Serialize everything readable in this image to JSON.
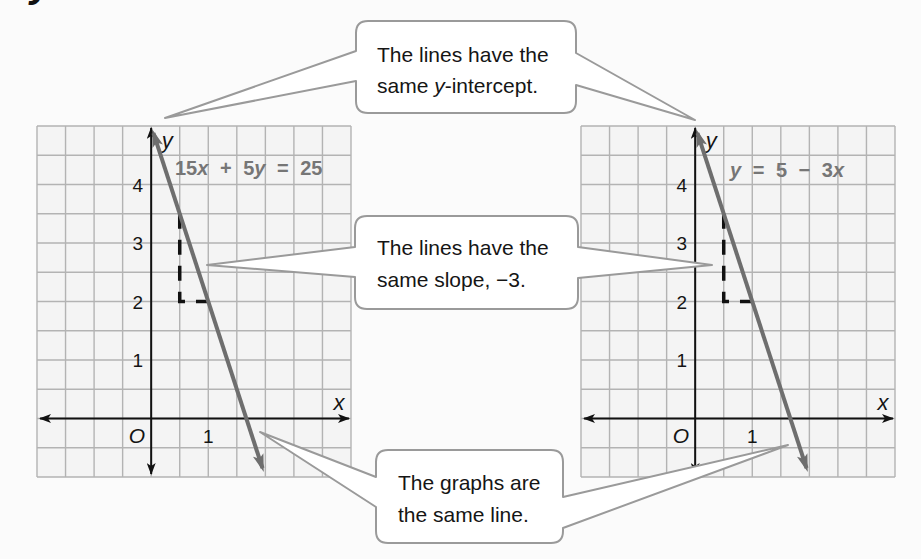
{
  "heading_fragment": "y",
  "colors": {
    "page_background": "#fbfbfb",
    "grid_fill": "#f4f4f4",
    "grid_line": "#b3b3b3",
    "axis": "#111111",
    "graph_line": "#6e6e6e",
    "slope_triangle": "#111111",
    "equation_text": "#767676",
    "callout_fill": "#ffffff",
    "callout_border": "#9a9a9a",
    "text": "#151515"
  },
  "callouts": [
    {
      "id": "same-y-intercept",
      "lines": [
        [
          {
            "text": "The lines have the"
          }
        ],
        [
          {
            "text": "same "
          },
          {
            "text": "y",
            "italic": true
          },
          {
            "text": "-intercept."
          }
        ]
      ]
    },
    {
      "id": "same-slope",
      "lines": [
        [
          {
            "text": "The lines have the"
          }
        ],
        [
          {
            "text": "same slope, −3."
          }
        ]
      ]
    },
    {
      "id": "same-line",
      "lines": [
        [
          {
            "text": "The graphs are"
          }
        ],
        [
          {
            "text": "the same line."
          }
        ]
      ]
    }
  ],
  "chart_data": [
    {
      "id": "standard-form",
      "type": "line",
      "title": "",
      "equation": "15x + 5y = 25",
      "equation_label": [
        {
          "text": "15"
        },
        {
          "text": "x",
          "italic": true
        },
        {
          "text": " + 5"
        },
        {
          "text": "y",
          "italic": true
        },
        {
          "text": " = 25"
        }
      ],
      "xlabel": "x",
      "ylabel": "y",
      "origin_label": "O",
      "xlim": [
        -2,
        3.5
      ],
      "ylim": [
        -1,
        5
      ],
      "grid": true,
      "grid_step": 0.5,
      "x_tick_labels": [
        {
          "value": 1,
          "label": "1"
        }
      ],
      "y_tick_labels": [
        {
          "value": 1,
          "label": "1"
        },
        {
          "value": 2,
          "label": "2"
        },
        {
          "value": 3,
          "label": "3"
        },
        {
          "value": 4,
          "label": "4"
        }
      ],
      "series": [
        {
          "name": "15x + 5y = 25",
          "slope": -3,
          "y_intercept": 5,
          "x": [
            0.04,
            1.95
          ],
          "y": [
            4.88,
            -0.85
          ],
          "arrows": "both"
        }
      ],
      "slope_triangle": {
        "points": [
          [
            0.5,
            3.5
          ],
          [
            0.5,
            2
          ],
          [
            1,
            2
          ]
        ],
        "rise": -1.5,
        "run": 0.5
      }
    },
    {
      "id": "slope-intercept-form",
      "type": "line",
      "title": "",
      "equation": "y = 5 − 3x",
      "equation_label": [
        {
          "text": "y",
          "italic": true
        },
        {
          "text": " = 5 − 3"
        },
        {
          "text": "x",
          "italic": true
        }
      ],
      "xlabel": "x",
      "ylabel": "y",
      "origin_label": "O",
      "xlim": [
        -2,
        3.5
      ],
      "ylim": [
        -1,
        5
      ],
      "grid": true,
      "grid_step": 0.5,
      "x_tick_labels": [
        {
          "value": 1,
          "label": "1"
        }
      ],
      "y_tick_labels": [
        {
          "value": 1,
          "label": "1"
        },
        {
          "value": 2,
          "label": "2"
        },
        {
          "value": 3,
          "label": "3"
        },
        {
          "value": 4,
          "label": "4"
        }
      ],
      "series": [
        {
          "name": "y = 5 − 3x",
          "slope": -3,
          "y_intercept": 5,
          "x": [
            0.04,
            1.95
          ],
          "y": [
            4.88,
            -0.85
          ],
          "arrows": "both"
        }
      ],
      "slope_triangle": {
        "points": [
          [
            0.5,
            3.5
          ],
          [
            0.5,
            2
          ],
          [
            1,
            2
          ]
        ],
        "rise": -1.5,
        "run": 0.5
      }
    }
  ]
}
